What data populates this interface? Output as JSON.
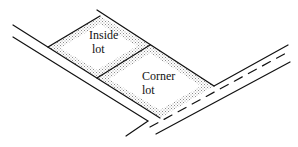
{
  "diagram": {
    "type": "lot-layout",
    "labels": {
      "inside_lot_line1": "Inside",
      "inside_lot_line2": "lot",
      "corner_lot_line1": "Corner",
      "corner_lot_line2": "lot"
    },
    "colors": {
      "line": "#111111",
      "stipple": "#9a9a9a",
      "lot_fill": "#ffffff",
      "background": "#ffffff"
    },
    "elements": [
      {
        "name": "inside-lot",
        "label": "Inside lot"
      },
      {
        "name": "corner-lot",
        "label": "Corner lot"
      },
      {
        "name": "side-street",
        "style": "two solid edges"
      },
      {
        "name": "main-street",
        "style": "two solid edges with dashed centerline"
      }
    ]
  }
}
